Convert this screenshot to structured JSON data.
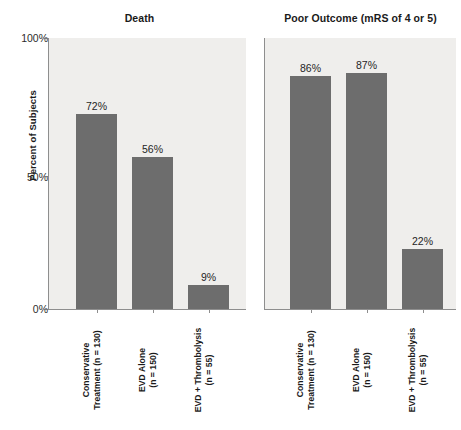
{
  "figure": {
    "ylabel": "Percent of Subjects",
    "yticks": [
      "100%",
      "50%",
      "0%"
    ]
  },
  "chart_data": {
    "type": "bar",
    "title": "",
    "xlabel": "",
    "ylabel": "Percent of Subjects",
    "ylim": [
      0,
      100
    ],
    "ytick_labels": [
      "0%",
      "50%",
      "100%"
    ],
    "ytick_values": [
      0,
      50,
      100
    ],
    "grid": false,
    "legend": "none",
    "categories": [
      "Conservative Treatment (n = 130)",
      "EVD Alone (n = 150)",
      "EVD + Thrombolysis (n = 55)"
    ],
    "category_lines": [
      [
        "Conservative",
        "Treatment (n = 130)"
      ],
      [
        "EVD Alone",
        "(n = 150)"
      ],
      [
        "EVD + Thrombolysis",
        "(n = 55)"
      ]
    ],
    "panels": [
      {
        "title": "Death",
        "values": [
          72,
          56,
          9
        ],
        "value_labels": [
          "72%",
          "56%",
          "9%"
        ]
      },
      {
        "title": "Poor Outcome (mRS of 4 or 5)",
        "values": [
          86,
          87,
          22
        ],
        "value_labels": [
          "86%",
          "87%",
          "22%"
        ]
      }
    ],
    "colors": {
      "bar": "#6d6d6d",
      "panel_background": "#efeeec",
      "axis": "#8e8e8e",
      "text": "#1a1a1a"
    }
  },
  "panels": {
    "left": {
      "title": "Death",
      "bars": [
        {
          "label": "72%",
          "value": 72
        },
        {
          "label": "56%",
          "value": 56
        },
        {
          "label": "9%",
          "value": 9
        }
      ]
    },
    "right": {
      "title": "Poor Outcome (mRS of 4 or 5)",
      "bars": [
        {
          "label": "86%",
          "value": 86
        },
        {
          "label": "87%",
          "value": 87
        },
        {
          "label": "22%",
          "value": 22
        }
      ]
    }
  },
  "categories": [
    {
      "line1": "Conservative",
      "line2": "Treatment (n = 130)"
    },
    {
      "line1": "EVD Alone",
      "line2": "(n = 150)"
    },
    {
      "line1": "EVD + Thrombolysis",
      "line2": "(n = 55)"
    }
  ]
}
